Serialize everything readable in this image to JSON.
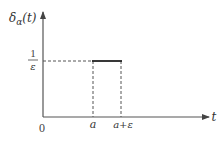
{
  "diagram": {
    "type": "function-plot",
    "y_axis_label_base": "δ",
    "y_axis_label_sub": "α",
    "y_axis_label_arg": "(t)",
    "x_axis_label": "t",
    "origin_label": "0",
    "y_tick_numerator": "1",
    "y_tick_denominator": "ε",
    "x_tick_a": "a",
    "x_tick_a_eps": "a+ε"
  },
  "colors": {
    "axis": "#555555",
    "pulse": "#222222",
    "dashed": "#555555",
    "text": "#333333"
  }
}
